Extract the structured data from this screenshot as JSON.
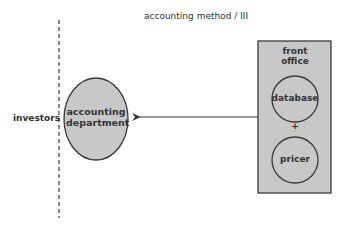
{
  "diagram": {
    "title": "accounting method / III",
    "left_label": "investors",
    "center_node": {
      "line1": "accounting",
      "line2": "department"
    },
    "right_box": {
      "title_line1": "front",
      "title_line2": "office",
      "components": [
        "database",
        "pricer"
      ],
      "joiner": "+"
    },
    "edges": [
      {
        "from": "front office",
        "to": "accounting department",
        "style": "arrow"
      }
    ],
    "colors": {
      "node_fill": "#c8c8c8",
      "box_fill": "#c8c8c8",
      "stroke": "#3a3a3a",
      "background": "#ffffff"
    }
  }
}
